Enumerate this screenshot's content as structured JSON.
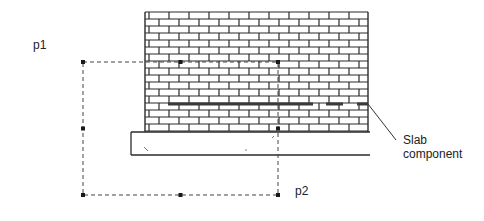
{
  "labels": {
    "p1": "p1",
    "p2": "p2",
    "slab_line1": "Slab",
    "slab_line2": "component"
  },
  "colors": {
    "brick_line": "#2a2a2a",
    "slab_line": "#3a3a3a",
    "selection_dash": "#444444",
    "handle": "#1a1a1a",
    "text": "#222222"
  },
  "wall": {
    "x": 145,
    "y": 12,
    "width": 223,
    "height": 120,
    "course_height": 7,
    "brick_width": 20
  },
  "slab": {
    "x": 131,
    "y": 132,
    "right": 370,
    "height": 23
  },
  "selection_box": {
    "x1": 83,
    "y1": 62,
    "x2": 278,
    "y2": 195
  },
  "slab_component_line": {
    "x1": 168,
    "y": 104,
    "x2": 368
  },
  "leader": {
    "x1": 368,
    "y1": 104,
    "x2": 396,
    "y2": 140
  }
}
